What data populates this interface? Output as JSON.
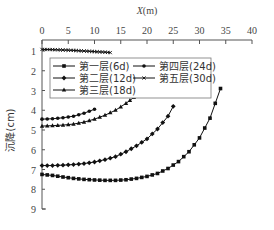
{
  "chart_data": {
    "type": "line",
    "title": "",
    "xlabel": "X(m)",
    "ylabel": "沉降(cm)",
    "xlim": [
      0,
      40
    ],
    "ylim": [
      0,
      9
    ],
    "y_inverted": true,
    "x_axis_position": "top",
    "xticks": [
      "0",
      "5",
      "10",
      "15",
      "20",
      "25",
      "30",
      "35",
      "40"
    ],
    "yticks": [
      "1",
      "2",
      "3",
      "4",
      "5",
      "6",
      "7",
      "8",
      "9"
    ],
    "grid": false,
    "legend_position": "upper-left inside",
    "series": [
      {
        "name": "第一层(6d)",
        "marker": "square",
        "x": [
          0,
          2,
          4,
          6,
          8,
          10,
          12,
          14,
          16,
          18,
          20,
          22,
          24,
          26,
          28,
          30,
          32,
          34
        ],
        "y": [
          7.25,
          7.3,
          7.38,
          7.45,
          7.5,
          7.53,
          7.55,
          7.55,
          7.52,
          7.45,
          7.35,
          7.2,
          6.95,
          6.6,
          6.1,
          5.4,
          4.4,
          2.9
        ]
      },
      {
        "name": "第二层(12d)",
        "marker": "diamond",
        "x": [
          0,
          2,
          4,
          6,
          8,
          10,
          12,
          14,
          16,
          18,
          20,
          22,
          24,
          25
        ],
        "y": [
          6.8,
          6.8,
          6.78,
          6.75,
          6.7,
          6.62,
          6.5,
          6.35,
          6.1,
          5.8,
          5.45,
          4.95,
          4.3,
          3.8
        ]
      },
      {
        "name": "第三层(18d)",
        "marker": "triangle",
        "x": [
          0,
          2,
          4,
          6,
          8,
          10,
          12,
          14,
          16,
          17.5
        ],
        "y": [
          4.8,
          4.78,
          4.75,
          4.7,
          4.6,
          4.45,
          4.25,
          4.0,
          3.65,
          3.35
        ]
      },
      {
        "name": "第四层(24d)",
        "marker": "circle",
        "x": [
          0,
          2,
          4,
          6,
          8,
          10
        ],
        "y": [
          4.45,
          4.43,
          4.38,
          4.3,
          4.15,
          3.95
        ]
      },
      {
        "name": "第五层(30d)",
        "marker": "cross",
        "x": [
          0,
          2,
          4,
          6,
          8,
          10,
          12,
          13
        ],
        "y": [
          0.92,
          0.93,
          0.95,
          0.97,
          1.0,
          1.03,
          1.06,
          1.08
        ]
      }
    ]
  },
  "axes": {
    "xlabel": "X(m)",
    "ylabel": "沉降(cm)"
  },
  "legend": {
    "items": [
      "第一层(6d)",
      "第二层(12d)",
      "第三层(18d)",
      "第四层(24d)",
      "第五层(30d)"
    ]
  }
}
